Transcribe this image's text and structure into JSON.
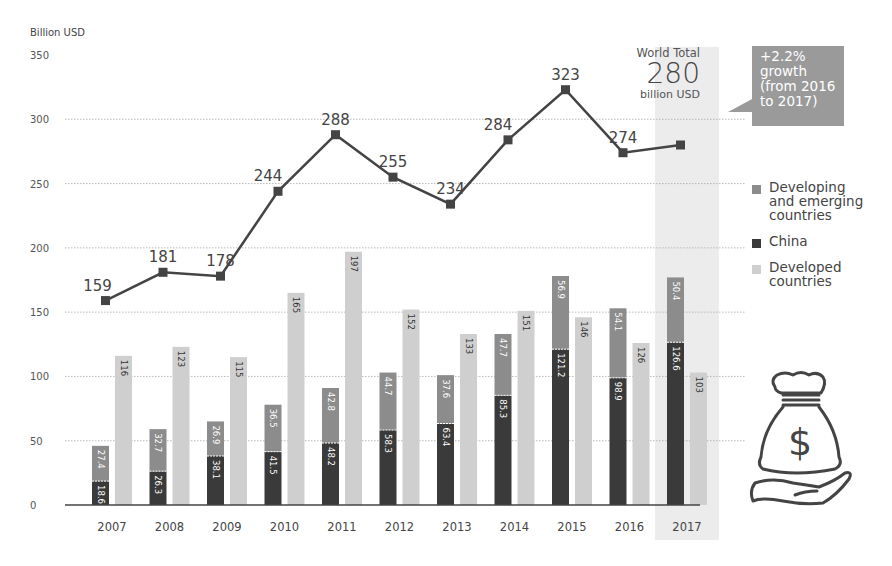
{
  "chart_data": {
    "type": "bar",
    "subtype": "grouped-stacked bar with line overlay",
    "title": "",
    "ylabel": "Billion USD",
    "xlabel": "",
    "ylim": [
      0,
      350
    ],
    "yticks": [
      0,
      50,
      100,
      150,
      200,
      250,
      300,
      350
    ],
    "grid": true,
    "categories": [
      "2007",
      "2008",
      "2009",
      "2010",
      "2011",
      "2012",
      "2013",
      "2014",
      "2015",
      "2016",
      "2017"
    ],
    "series": [
      {
        "name": "China",
        "stack": "developing",
        "color": "#3a3a3a",
        "values": [
          18.6,
          26.3,
          38.1,
          41.5,
          48.2,
          58.3,
          63.4,
          85.3,
          121.2,
          98.9,
          126.6
        ]
      },
      {
        "name": "Developing and emerging countries",
        "stack": "developing",
        "color": "#8c8c8c",
        "values": [
          27.4,
          32.7,
          26.9,
          36.5,
          42.8,
          44.7,
          37.6,
          47.7,
          56.9,
          54.1,
          50.4
        ]
      },
      {
        "name": "Developed countries",
        "stack": "developed",
        "color": "#cfcfcf",
        "values": [
          116,
          123,
          115,
          165,
          197,
          152,
          133,
          151,
          146,
          126,
          103
        ]
      },
      {
        "name": "World Total",
        "type": "line",
        "color": "#444444",
        "values": [
          159,
          181,
          178,
          244,
          288,
          255,
          234,
          284,
          323,
          274,
          280
        ]
      }
    ],
    "line_labels": [
      "159",
      "181",
      "178",
      "244",
      "288",
      "255",
      "234",
      "284",
      "323",
      "274",
      ""
    ],
    "highlight_category": "2017",
    "legend_position": "right",
    "annotations": {
      "world_total_label": "World Total",
      "world_total_value": "280",
      "world_total_unit": "billion USD",
      "growth_callout": "+2.2%\ngrowth\n(from 2016\nto 2017)"
    }
  },
  "axis": {
    "unit_label": "Billion USD"
  },
  "legend": {
    "items": [
      {
        "label": "Developing\nand emerging\ncountries",
        "color": "#8c8c8c"
      },
      {
        "label": "China",
        "color": "#3a3a3a"
      },
      {
        "label": "Developed\ncountries",
        "color": "#cfcfcf"
      }
    ]
  },
  "callout": {
    "world_total_label": "World Total",
    "world_total_value": "280",
    "world_total_unit": "billion USD",
    "growth_text": "+2.2%\ngrowth\n(from 2016\nto 2017)"
  },
  "icon": {
    "name": "money-bag-hand-icon"
  }
}
